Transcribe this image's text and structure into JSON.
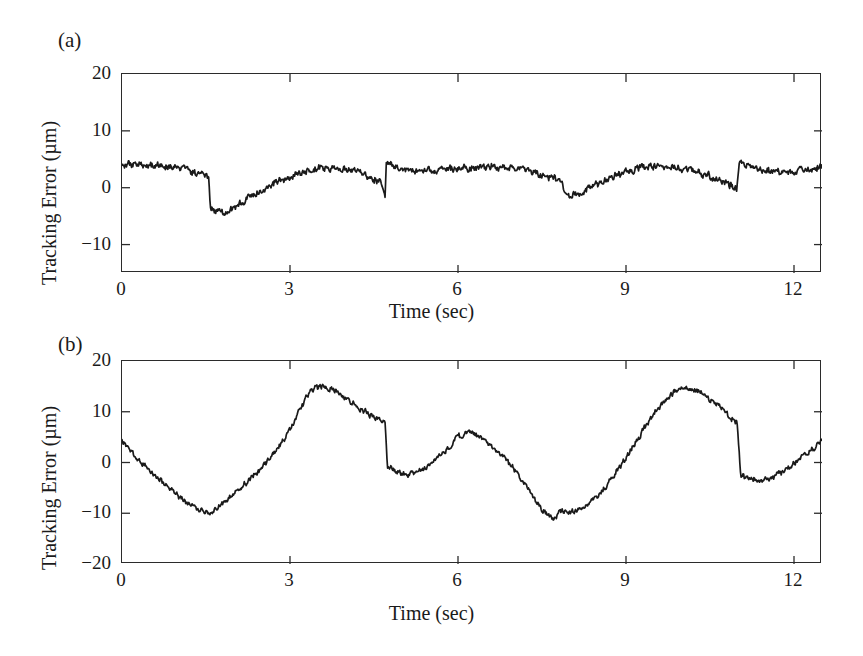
{
  "figure": {
    "background": "#ffffff",
    "line_color": "#1a1a1a",
    "axis_color": "#2b2b2b"
  },
  "panels": [
    {
      "tag": "(a)",
      "xlabel": "Time (sec)",
      "ylabel": "Tracking Error (µm)",
      "ytick_labels": [
        "20",
        "10",
        "0",
        "−10"
      ],
      "xtick_labels": [
        "0",
        "3",
        "6",
        "9",
        "12"
      ]
    },
    {
      "tag": "(b)",
      "xlabel": "Time (sec)",
      "ylabel": "Tracking Error (µm)",
      "ytick_labels": [
        "20",
        "10",
        "0",
        "−10",
        "−20"
      ],
      "xtick_labels": [
        "0",
        "3",
        "6",
        "9",
        "12"
      ]
    }
  ],
  "chart_data": [
    {
      "type": "line",
      "title": "(a)",
      "xlabel": "Time (sec)",
      "ylabel": "Tracking Error (µm)",
      "xlim": [
        0,
        12.5
      ],
      "ylim": [
        -15,
        20
      ],
      "yticks": [
        20,
        10,
        0,
        -10
      ],
      "xticks": [
        0,
        3,
        6,
        9,
        12
      ],
      "grid": false,
      "legend": null,
      "series": [
        {
          "name": "Tracking Error (a)",
          "x": [
            0.0,
            0.1,
            0.2,
            0.3,
            0.4,
            0.5,
            0.6,
            0.7,
            0.8,
            0.9,
            1.0,
            1.1,
            1.2,
            1.3,
            1.4,
            1.5,
            1.55,
            1.58,
            1.7,
            1.85,
            2.0,
            2.15,
            2.3,
            2.45,
            2.6,
            2.8,
            3.0,
            3.2,
            3.4,
            3.55,
            3.7,
            3.85,
            4.0,
            4.2,
            4.35,
            4.5,
            4.65,
            4.7,
            4.72,
            4.85,
            5.0,
            5.2,
            5.4,
            5.6,
            5.8,
            6.0,
            6.2,
            6.4,
            6.6,
            6.8,
            7.0,
            7.2,
            7.4,
            7.6,
            7.8,
            7.88,
            7.92,
            8.1,
            8.3,
            8.5,
            8.7,
            8.9,
            9.1,
            9.3,
            9.5,
            9.7,
            9.9,
            10.1,
            10.3,
            10.5,
            10.7,
            10.9,
            10.98,
            11.02,
            11.15,
            11.3,
            11.5,
            11.7,
            11.9,
            12.1,
            12.3,
            12.5
          ],
          "y": [
            4.0,
            4.3,
            3.9,
            4.2,
            3.7,
            4.0,
            3.6,
            3.9,
            3.4,
            3.7,
            3.2,
            3.5,
            3.0,
            2.6,
            2.3,
            2.0,
            1.9,
            -3.4,
            -4.3,
            -4.5,
            -3.6,
            -2.6,
            -1.5,
            -0.6,
            0.2,
            1.1,
            1.9,
            2.6,
            3.2,
            3.5,
            3.3,
            3.6,
            3.4,
            2.9,
            2.2,
            1.4,
            0.6,
            -1.6,
            4.6,
            4.0,
            3.3,
            3.0,
            3.2,
            3.1,
            3.4,
            3.3,
            3.6,
            3.5,
            3.8,
            3.7,
            3.5,
            3.2,
            2.7,
            2.0,
            1.2,
            0.5,
            -1.8,
            -1.2,
            -0.4,
            0.6,
            1.6,
            2.4,
            3.1,
            3.6,
            3.9,
            3.7,
            3.6,
            3.3,
            2.7,
            1.9,
            1.1,
            0.4,
            -0.3,
            4.7,
            4.1,
            3.4,
            3.0,
            2.7,
            2.6,
            2.9,
            3.3,
            3.8
          ]
        }
      ]
    },
    {
      "type": "line",
      "title": "(b)",
      "xlabel": "Time (sec)",
      "ylabel": "Tracking Error (µm)",
      "xlim": [
        0,
        12.5
      ],
      "ylim": [
        -20,
        20
      ],
      "yticks": [
        20,
        10,
        0,
        -10,
        -20
      ],
      "xticks": [
        0,
        3,
        6,
        9,
        12
      ],
      "grid": false,
      "legend": null,
      "series": [
        {
          "name": "Tracking Error (b)",
          "x": [
            0.0,
            0.1,
            0.25,
            0.4,
            0.55,
            0.7,
            0.85,
            1.0,
            1.15,
            1.3,
            1.45,
            1.55,
            1.62,
            1.7,
            1.85,
            2.0,
            2.2,
            2.4,
            2.6,
            2.8,
            3.0,
            3.15,
            3.3,
            3.45,
            3.6,
            3.8,
            4.0,
            4.2,
            4.4,
            4.6,
            4.7,
            4.74,
            4.9,
            5.1,
            5.3,
            5.5,
            5.7,
            5.9,
            6.0,
            6.2,
            6.4,
            6.6,
            6.8,
            7.0,
            7.15,
            7.3,
            7.4,
            7.5,
            7.65,
            7.75,
            7.82,
            7.9,
            8.1,
            8.3,
            8.5,
            8.7,
            8.9,
            9.1,
            9.3,
            9.5,
            9.7,
            9.9,
            10.1,
            10.3,
            10.5,
            10.7,
            10.9,
            10.98,
            11.05,
            11.2,
            11.4,
            11.6,
            11.8,
            12.0,
            12.2,
            12.4,
            12.5
          ],
          "y": [
            4.2,
            3.0,
            1.2,
            -0.5,
            -2.2,
            -3.7,
            -5.2,
            -6.6,
            -7.8,
            -8.8,
            -9.6,
            -10.1,
            -9.8,
            -8.9,
            -7.6,
            -6.2,
            -4.2,
            -2.1,
            0.3,
            3.0,
            6.4,
            9.8,
            13.0,
            14.8,
            15.0,
            14.2,
            12.6,
            11.0,
            9.6,
            8.4,
            7.6,
            -1.1,
            -1.9,
            -2.4,
            -1.8,
            -0.4,
            1.4,
            3.6,
            5.2,
            5.9,
            4.9,
            3.2,
            1.2,
            -1.2,
            -3.4,
            -5.8,
            -7.6,
            -9.2,
            -10.6,
            -11.2,
            -9.2,
            -9.8,
            -9.6,
            -8.4,
            -6.4,
            -3.8,
            -0.8,
            2.6,
            6.2,
            9.6,
            12.4,
            14.2,
            14.9,
            14.0,
            12.4,
            10.6,
            8.6,
            7.9,
            -2.6,
            -3.3,
            -3.6,
            -3.1,
            -1.8,
            -0.2,
            1.6,
            3.3,
            4.6,
            5.0
          ]
        }
      ]
    }
  ]
}
